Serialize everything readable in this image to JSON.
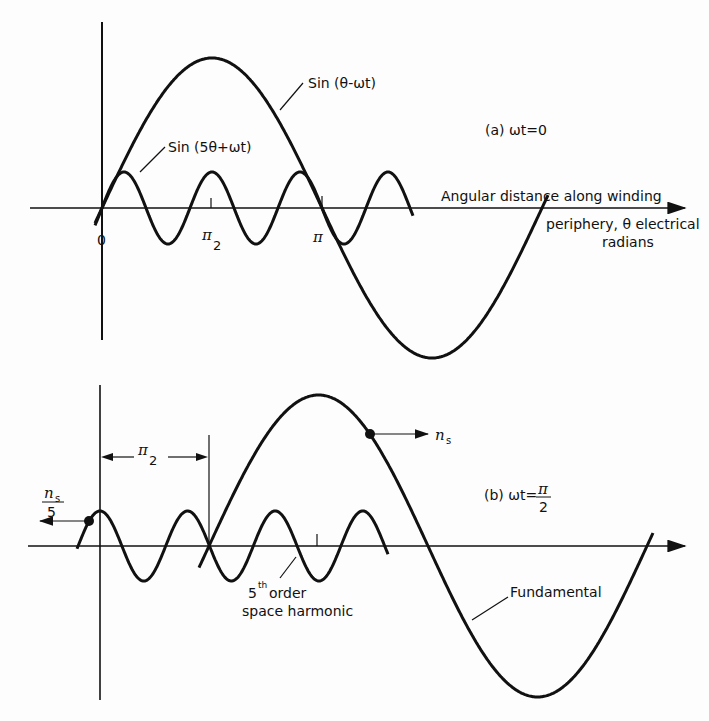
{
  "panel_a": {
    "fundamental_label": "Sin (θ-ωt)",
    "harmonic_label": "Sin (5θ+ωt)",
    "condition": "(a) ωt=0",
    "tick_0": "0",
    "tick_pi2_num": "π",
    "tick_pi2_den": "2",
    "tick_pi": "π",
    "axis_label_1": "Angular distance along winding",
    "axis_label_2": "periphery, θ electrical",
    "axis_label_3": "radians"
  },
  "panel_b": {
    "condition_prefix": "(b) ωt=",
    "condition_num": "π",
    "condition_den": "2",
    "dimension_num": "π",
    "dimension_den": "2",
    "ns_label": "n",
    "ns_sub": "s",
    "ns5_label": "n",
    "ns5_sub": "s",
    "ns5_den": "5",
    "harmonic_label_1": "5",
    "harmonic_label_sup": "th",
    "harmonic_label_2": "order",
    "harmonic_label_3": "space harmonic",
    "fundamental_label": "Fundamental"
  },
  "chart_data": {
    "type": "line",
    "xlabel": "Angular distance along winding periphery, θ electrical radians",
    "panels": [
      {
        "name": "(a) ωt=0",
        "series": [
          {
            "name": "Sin (θ-ωt)",
            "amplitude": 1.0,
            "order": 1,
            "phase_shift": 0
          },
          {
            "name": "Sin (5θ+ωt)",
            "amplitude": 0.23,
            "order": 5,
            "phase_shift": 0
          }
        ],
        "x_ticks": [
          "0",
          "π/2",
          "π"
        ]
      },
      {
        "name": "(b) ωt=π/2",
        "series": [
          {
            "name": "Fundamental",
            "amplitude": 1.0,
            "order": 1,
            "shift": "π/2 forward",
            "speed": "n_s"
          },
          {
            "name": "5th order space harmonic",
            "amplitude": 0.23,
            "order": 5,
            "shift": "backward",
            "speed": "n_s/5"
          }
        ],
        "annotations": [
          "π/2",
          "n_s",
          "n_s/5"
        ]
      }
    ]
  }
}
